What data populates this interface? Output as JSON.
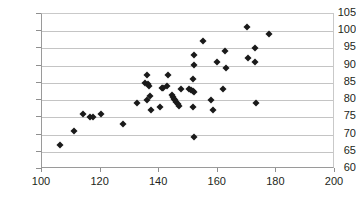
{
  "chart_data": {
    "type": "scatter",
    "title": "",
    "xlabel": "",
    "ylabel": "",
    "xlim": [
      100,
      200
    ],
    "ylim": [
      60,
      105
    ],
    "xticks": [
      100,
      120,
      140,
      160,
      180,
      200
    ],
    "yticks": [
      60,
      65,
      70,
      75,
      80,
      85,
      90,
      95,
      100,
      105
    ],
    "grid": true,
    "legend": false,
    "marker": "diamond",
    "marker_color": "#1a1a1a",
    "series": [
      {
        "name": "series-1",
        "points": [
          [
            106.0,
            67.0
          ],
          [
            111.0,
            71.0
          ],
          [
            114.0,
            76.0
          ],
          [
            116.5,
            75.2
          ],
          [
            117.5,
            75.1
          ],
          [
            120.0,
            76.0
          ],
          [
            127.8,
            73.1
          ],
          [
            132.5,
            79.2
          ],
          [
            135.0,
            85.1
          ],
          [
            136.0,
            87.2
          ],
          [
            136.2,
            84.6
          ],
          [
            136.6,
            84.2
          ],
          [
            136.0,
            80.1
          ],
          [
            137.0,
            81.2
          ],
          [
            137.2,
            77.1
          ],
          [
            140.2,
            78.1
          ],
          [
            140.8,
            83.6
          ],
          [
            141.4,
            83.4
          ],
          [
            142.6,
            84.2
          ],
          [
            143.0,
            87.2
          ],
          [
            144.2,
            81.4
          ],
          [
            144.6,
            80.9
          ],
          [
            145.0,
            80.4
          ],
          [
            145.4,
            79.9
          ],
          [
            145.9,
            79.4
          ],
          [
            146.4,
            78.9
          ],
          [
            146.8,
            78.4
          ],
          [
            147.6,
            83.1
          ],
          [
            150.2,
            83.2
          ],
          [
            150.8,
            82.9
          ],
          [
            151.4,
            82.6
          ],
          [
            151.8,
            82.3
          ],
          [
            151.6,
            86.1
          ],
          [
            151.8,
            90.1
          ],
          [
            152.0,
            93.1
          ],
          [
            151.6,
            78.1
          ],
          [
            152.0,
            69.2
          ],
          [
            154.8,
            97.1
          ],
          [
            157.8,
            80.1
          ],
          [
            158.2,
            77.1
          ],
          [
            159.6,
            91.1
          ],
          [
            161.8,
            83.2
          ],
          [
            162.6,
            94.2
          ],
          [
            162.8,
            89.2
          ],
          [
            169.8,
            101.1
          ],
          [
            170.2,
            92.2
          ],
          [
            172.8,
            95.0
          ],
          [
            172.6,
            91.2
          ],
          [
            173.0,
            79.2
          ],
          [
            177.6,
            99.1
          ]
        ]
      }
    ]
  }
}
